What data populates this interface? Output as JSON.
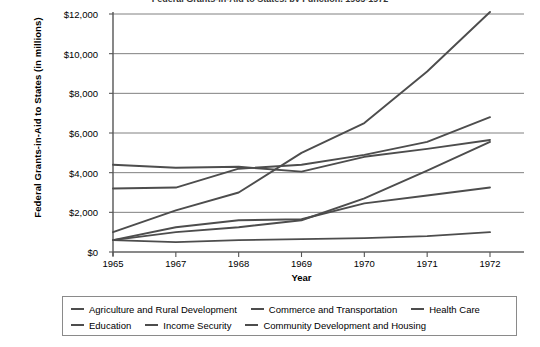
{
  "title_clipped": "Federal Grants-in-Aid to States, by Function, 1965-1972",
  "axis": {
    "ylabel": "Federal Grants-in-Aid to States (in millions)",
    "xlabel": "Year",
    "yticks": [
      "$0",
      "$2,000",
      "$4,000",
      "$6,000",
      "$8,000",
      "$10,000",
      "$12,000"
    ],
    "xticks": [
      "1965",
      "1967",
      "1968",
      "1969",
      "1970",
      "1971",
      "1972"
    ]
  },
  "legend": {
    "row1": [
      {
        "label": "Agriculture and Rural Development"
      },
      {
        "label": "Commerce and Transportation"
      },
      {
        "label": "Health Care"
      }
    ],
    "row2": [
      {
        "label": "Education"
      },
      {
        "label": "Income Security"
      },
      {
        "label": "Community Development and Housing"
      }
    ]
  },
  "colors": {
    "line": "#4d4d4d",
    "grid": "#808080",
    "axis": "#555555",
    "legend_border": "#8a8a8a",
    "background": "#ffffff"
  },
  "chart_data": {
    "type": "line",
    "title": "Federal Grants-in-Aid to States, by Function, 1965-1972",
    "xlabel": "Year",
    "ylabel": "Federal Grants-in-Aid to States (in millions)",
    "categories": [
      "1965",
      "1967",
      "1968",
      "1969",
      "1970",
      "1971",
      "1972"
    ],
    "x": [
      1965,
      1967,
      1968,
      1969,
      1970,
      1971,
      1972
    ],
    "ylim": [
      0,
      12000
    ],
    "yticks": [
      0,
      2000,
      4000,
      6000,
      8000,
      10000,
      12000
    ],
    "grid": true,
    "legend_position": "bottom",
    "units": "millions of dollars",
    "series": [
      {
        "name": "Agriculture and Rural Development",
        "values": [
          1000,
          2100,
          3000,
          5000,
          6500,
          9100,
          12100
        ]
      },
      {
        "name": "Commerce and Transportation",
        "values": [
          600,
          1250,
          1600,
          1650,
          2450,
          2850,
          3250
        ]
      },
      {
        "name": "Health Care",
        "values": [
          4400,
          4250,
          4300,
          4050,
          4800,
          5200,
          5650
        ]
      },
      {
        "name": "Education",
        "values": [
          3200,
          3250,
          4200,
          4400,
          4900,
          5550,
          6800
        ]
      },
      {
        "name": "Income Security",
        "values": [
          600,
          500,
          600,
          650,
          700,
          800,
          1000
        ]
      },
      {
        "name": "Community Development and Housing",
        "values": [
          600,
          1000,
          1250,
          1600,
          2700,
          4100,
          5550
        ]
      }
    ]
  }
}
